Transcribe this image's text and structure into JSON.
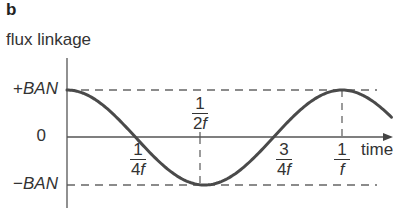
{
  "panel_label": "b",
  "chart_data": {
    "type": "line",
    "title": "",
    "panel": "b",
    "xlabel": "time",
    "ylabel": "flux linkage",
    "function": "BAN·cos(2πft)",
    "x_ticks": [
      {
        "num": "1",
        "den_prefix": "4",
        "den_var": "f",
        "value": 0.25
      },
      {
        "num": "1",
        "den_prefix": "2",
        "den_var": "f",
        "value": 0.5
      },
      {
        "num": "3",
        "den_prefix": "4",
        "den_var": "f",
        "value": 0.75
      },
      {
        "num": "1",
        "den_prefix": "",
        "den_var": "f",
        "value": 1.0
      }
    ],
    "y_ticks": [
      {
        "sign": "+",
        "label": "BAN",
        "value": 1
      },
      {
        "sign": "",
        "label": "0",
        "value": 0
      },
      {
        "sign": "−",
        "label": "BAN",
        "value": -1
      }
    ],
    "x": [
      0,
      0.125,
      0.25,
      0.375,
      0.5,
      0.625,
      0.75,
      0.875,
      1.0,
      1.18
    ],
    "values": [
      1,
      0.707,
      0,
      -0.707,
      -1,
      -0.707,
      0,
      0.707,
      1,
      0.43
    ],
    "x_units": "periods (1/f)",
    "y_units": "BAN",
    "guides": "dashed horizontal lines at +BAN and −BAN; dashed vertical lines at 1/2f and 1/f",
    "grid": false,
    "legend": null
  },
  "colors": {
    "curve": "#4a4a4a",
    "axis": "#555555",
    "dashed": "#666666",
    "text": "#333333"
  }
}
